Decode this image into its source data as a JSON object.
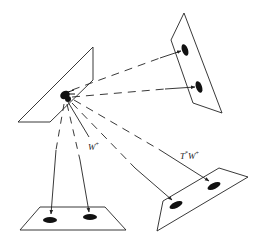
{
  "diagram": {
    "type": "projection-schematic",
    "colors": {
      "stroke": "#222222",
      "fill_dot": "#111111",
      "background": "#ffffff"
    },
    "planes": [
      {
        "id": "source-plane",
        "points": "18,122 93,47 93,80 50,122"
      },
      {
        "id": "top-right-plane",
        "points": "184,13 171,40 193,103 222,113"
      },
      {
        "id": "bottom-left-plane",
        "points": "20,230 40,207 105,207 126,230"
      },
      {
        "id": "bottom-right-plane",
        "points": "163,201 219,168 248,177 157,231"
      }
    ],
    "source": {
      "x": 65,
      "y": 96
    },
    "targets": [
      {
        "id": "tr-dot-1",
        "x": 185,
        "y": 50,
        "rx": 3,
        "ry": 6,
        "rot": -20
      },
      {
        "id": "tr-dot-2",
        "x": 199,
        "y": 87,
        "rx": 3,
        "ry": 6,
        "rot": -20
      },
      {
        "id": "bl-dot-1",
        "x": 50,
        "y": 220,
        "rx": 7,
        "ry": 3,
        "rot": 0
      },
      {
        "id": "bl-dot-2",
        "x": 90,
        "y": 217,
        "rx": 7,
        "ry": 3,
        "rot": 0
      },
      {
        "id": "br-dot-1",
        "x": 176,
        "y": 205,
        "rx": 7,
        "ry": 3,
        "rot": -25
      },
      {
        "id": "br-dot-2",
        "x": 214,
        "y": 186,
        "rx": 7,
        "ry": 3,
        "rot": -25
      }
    ],
    "labels": {
      "w_label": {
        "base": "W",
        "sup": "+",
        "x": 88,
        "y": 141
      },
      "tw_label": {
        "base": "T",
        "sup1": "*",
        "mid": "W",
        "sup2": "+",
        "x": 180,
        "y": 150
      }
    }
  }
}
